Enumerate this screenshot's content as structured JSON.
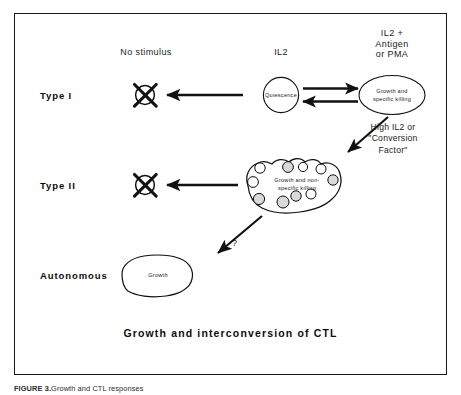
{
  "figure": {
    "title": "Growth and interconversion of CTL",
    "caption_label": "FIGURE 3.",
    "caption_text": "Growth and CTL responses"
  },
  "rows": [
    {
      "id": "type-i",
      "name": "Type I"
    },
    {
      "id": "type-ii",
      "name": "Type II"
    },
    {
      "id": "autonomous",
      "name": "Autonomous"
    }
  ],
  "columns": {
    "no_stimulus": "No stimulus",
    "il2": "IL2",
    "il2_antigen_pma": "IL2 +\nAntigen\nor PMA"
  },
  "shapes": {
    "quiescence": "Quiescence",
    "growth_specific_killing": "Growth and\nspecific killing",
    "growth_nonspecific_killing": "Growth and non-\nspecific killing",
    "autonomous_growth": "Growth"
  },
  "annotations": {
    "conversion": "High IL2 or\n\"Conversion\nFactor\"",
    "unknown": "?"
  },
  "colors": {
    "ink": "#1a1a1a",
    "frame": "#1a1a1a",
    "page": "#ffffff",
    "cell_fill": "#d9d9d9"
  }
}
